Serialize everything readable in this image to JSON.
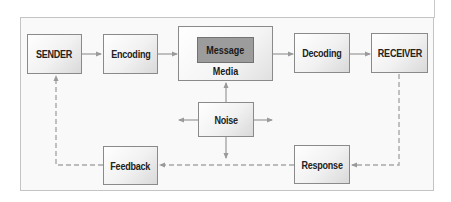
{
  "diagram": {
    "nodes": {
      "sender": "SENDER",
      "encoding": "Encoding",
      "message": "Message",
      "media": "Media",
      "decoding": "Decoding",
      "receiver": "RECEIVER",
      "noise": "Noise",
      "response": "Response",
      "feedback": "Feedback"
    },
    "edges": [
      {
        "from": "SENDER",
        "to": "Encoding",
        "style": "solid"
      },
      {
        "from": "Encoding",
        "to": "Media",
        "style": "solid"
      },
      {
        "from": "Media",
        "to": "Decoding",
        "style": "solid"
      },
      {
        "from": "Decoding",
        "to": "RECEIVER",
        "style": "solid"
      },
      {
        "from": "Noise",
        "to": "Media",
        "style": "solid"
      },
      {
        "from": "Noise",
        "to": "left",
        "style": "solid"
      },
      {
        "from": "Noise",
        "to": "right",
        "style": "solid"
      },
      {
        "from": "Noise",
        "to": "down",
        "style": "solid"
      },
      {
        "from": "RECEIVER",
        "to": "Response",
        "style": "dashed"
      },
      {
        "from": "Response",
        "to": "Feedback",
        "style": "dashed"
      },
      {
        "from": "Feedback",
        "to": "SENDER",
        "style": "dashed"
      }
    ],
    "colors": {
      "box_border": "#8a8a8a",
      "message_fill": "#9c9c9c",
      "arrow": "#a0a0a0",
      "frame_border": "#c4c4c4"
    }
  }
}
